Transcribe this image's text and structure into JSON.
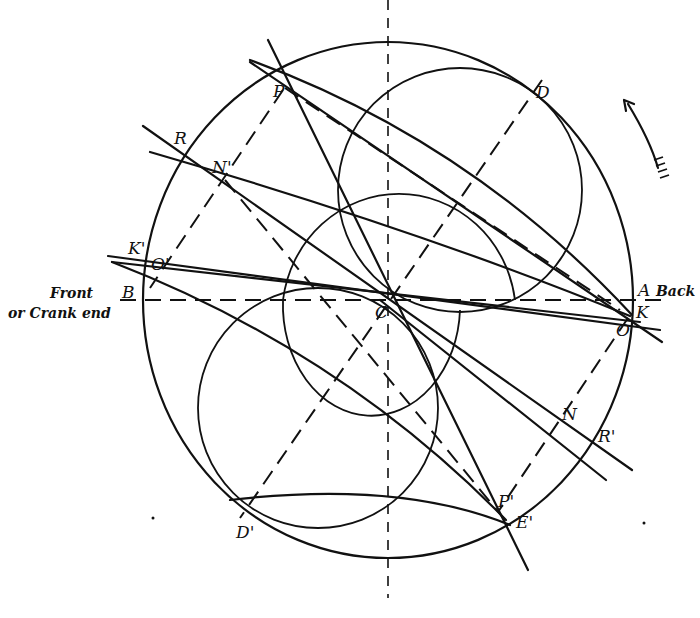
{
  "figure": {
    "type": "engineering construction diagram (crank / valve circle)",
    "labels": {
      "P": "P",
      "D": "D",
      "R": "R",
      "N_prime": "N'",
      "K_prime": "K'",
      "O_prime": "O'",
      "B": "B",
      "C": "C",
      "A": "A",
      "K": "K",
      "O": "O",
      "N": "N",
      "R_prime": "R'",
      "P_prime": "P'",
      "E_prime": "E'",
      "D_prime": "D'"
    },
    "annotations": {
      "front_line1": "Front",
      "front_line2": "or Crank end",
      "back": "Back"
    },
    "rotation_arrow": "counter-clockwise arrow (direction of rotation)",
    "colors": {
      "ink": "#111111",
      "paper": "#ffffff"
    }
  }
}
